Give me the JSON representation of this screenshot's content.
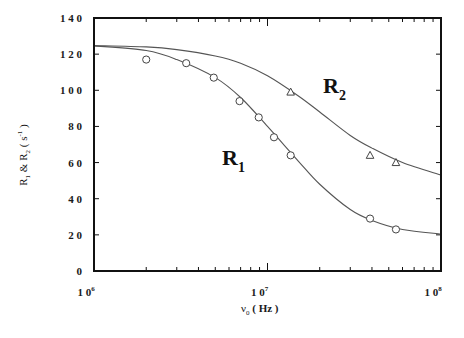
{
  "chart_data": {
    "type": "scatter",
    "title": "",
    "xlabel": "ν0 (Hz)",
    "ylabel": "R1 & R2 (s-1)",
    "xscale": "log",
    "xlim": [
      1000000,
      100000000
    ],
    "ylim": [
      0,
      140
    ],
    "grid": false,
    "legend": "none (inline curve labels)",
    "x_tick_labels": [
      {
        "base": "1 0",
        "exp": "6",
        "value": 1000000
      },
      {
        "base": "1 0",
        "exp": "7",
        "value": 10000000
      },
      {
        "base": "1 0",
        "exp": "8",
        "value": 100000000
      }
    ],
    "y_tick_labels": [
      "0",
      "2 0",
      "4 0",
      "6 0",
      "8 0",
      "1 0 0",
      "1 2 0",
      "1 4 0"
    ],
    "y_ticks": [
      0,
      20,
      40,
      60,
      80,
      100,
      120,
      140
    ],
    "annotations": [
      {
        "text": "R",
        "sub": "1",
        "x": 12000000,
        "y": 60
      },
      {
        "text": "R",
        "sub": "2",
        "x": 22000000,
        "y": 100
      }
    ],
    "series": [
      {
        "name": "R1",
        "marker": "circle",
        "x": [
          2000000,
          3400000,
          4900000,
          6900000,
          8900000,
          10900000,
          13600000,
          39000000,
          55000000
        ],
        "y": [
          117,
          115,
          107,
          94,
          85,
          74,
          64,
          29,
          23
        ]
      },
      {
        "name": "R2",
        "marker": "triangle",
        "x": [
          13600000,
          39000000,
          55000000
        ],
        "y": [
          99,
          64,
          60
        ]
      },
      {
        "name": "R1 fit",
        "marker": "line",
        "x": [
          1000000,
          2000000,
          3000000,
          5000000,
          7000000,
          10000000,
          15000000,
          20000000,
          30000000,
          40000000,
          60000000,
          100000000
        ],
        "y": [
          124.6,
          122,
          117,
          107,
          96,
          80,
          61,
          48,
          34,
          28,
          23,
          20.5
        ]
      },
      {
        "name": "R2 fit",
        "marker": "line",
        "x": [
          1000000,
          2000000,
          3000000,
          5000000,
          7000000,
          10000000,
          15000000,
          20000000,
          30000000,
          40000000,
          60000000,
          100000000
        ],
        "y": [
          124.8,
          124,
          122.5,
          119,
          115,
          108,
          97,
          88,
          75,
          68,
          60,
          53
        ]
      }
    ]
  },
  "labels": {
    "y_axis_main": "R",
    "y_axis_sub1": "1",
    "y_axis_amp": " & R",
    "y_axis_sub2": "2",
    "y_axis_unit_open": " ( s",
    "y_axis_unit_exp": "-1",
    "y_axis_unit_close": " )",
    "x_axis_symbol": "ν",
    "x_axis_sub": "0",
    "x_axis_unit": " ( Hz )",
    "r1_main": "R",
    "r1_sub": "1",
    "r2_main": "R",
    "r2_sub": "2"
  }
}
